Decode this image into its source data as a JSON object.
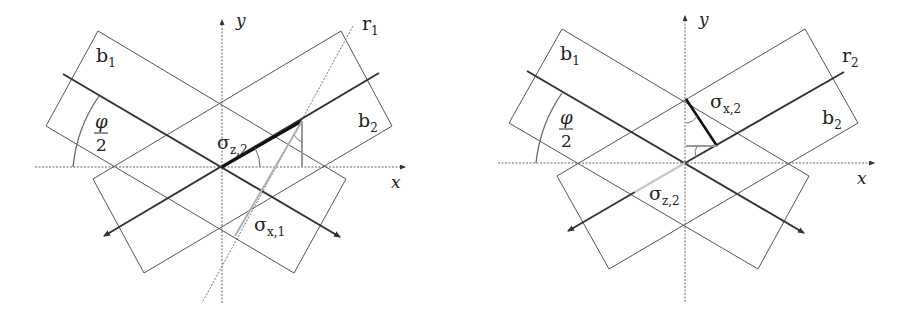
{
  "figure": {
    "panels": [
      {
        "id": "left",
        "axis_x_label": "x",
        "axis_y_label": "y",
        "beam1_label": "b",
        "beam1_sub": "1",
        "beam2_label": "b",
        "beam2_sub": "2",
        "ray_label": "r",
        "ray_sub": "1",
        "angle_num": "φ",
        "angle_den": "2",
        "sigma_a_main": "σ",
        "sigma_a_sub": "z,2",
        "sigma_b_main": "σ",
        "sigma_b_sub": "x,1"
      },
      {
        "id": "right",
        "axis_x_label": "x",
        "axis_y_label": "y",
        "beam1_label": "b",
        "beam1_sub": "1",
        "beam2_label": "b",
        "beam2_sub": "2",
        "ray_label": "r",
        "ray_sub": "2",
        "angle_num": "φ",
        "angle_den": "2",
        "sigma_a_main": "σ",
        "sigma_a_sub": "x,2",
        "sigma_b_main": "σ",
        "sigma_b_sub": "z,2"
      }
    ],
    "colors": {
      "outline": "#555555",
      "axis_thick": "#333333",
      "highlight": "#111111",
      "gray": "#9a9a9a",
      "light_gray": "#c8c8c8"
    }
  }
}
